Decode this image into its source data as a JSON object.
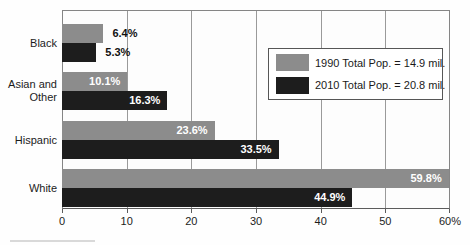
{
  "chart_data": {
    "type": "bar",
    "orientation": "horizontal",
    "title": "",
    "categories": [
      "Black",
      "Asian and Other",
      "Hispanic",
      "White"
    ],
    "series": [
      {
        "name": "1990 Total Pop. = 14.9 mil.",
        "color": "#8c8c8c",
        "values": [
          6.4,
          10.1,
          23.6,
          59.8
        ]
      },
      {
        "name": "2010 Total Pop. = 20.8 mil.",
        "color": "#1d1d1d",
        "values": [
          5.3,
          16.3,
          33.5,
          44.9
        ]
      }
    ],
    "value_suffix": "%",
    "value_labels": [
      [
        "6.4%",
        "10.1%",
        "23.6%",
        "59.8%"
      ],
      [
        "5.3%",
        "16.3%",
        "33.5%",
        "44.9%"
      ]
    ],
    "xlim": [
      0,
      60
    ],
    "x_ticks": [
      0,
      10,
      20,
      30,
      40,
      50,
      60
    ],
    "x_tick_labels": [
      "0",
      "10",
      "20",
      "30",
      "40",
      "50",
      "60%"
    ],
    "grid": true,
    "legend_position": "top-right",
    "colors": {
      "series_1990": "#8c8c8c",
      "series_2010": "#1d1d1d",
      "frame": "#858585",
      "gridline": "#9a9a9a",
      "inside_label_text": "#ffffff",
      "outside_label_text": "#111111"
    }
  }
}
